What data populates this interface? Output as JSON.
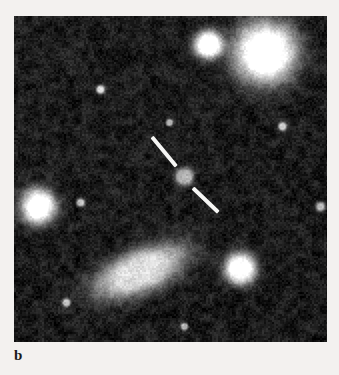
{
  "figure": {
    "panel_letter": "b",
    "kind": "astronomical-ccd-image",
    "background_color": "#f3f1ef",
    "sky_color": "#0b0b0b",
    "marker_color": "#f6f6f4"
  },
  "image_panel": {
    "x": 14,
    "y": 16,
    "width": 313,
    "height": 326,
    "noise": {
      "seed": 20240517,
      "cell_size": 2,
      "base_level": 14,
      "amplitude": 30,
      "blotch_scale": 7,
      "blotch_amplitude": 16
    }
  },
  "sources": [
    {
      "name": "bright-star-upper-right",
      "cx": 251,
      "cy": 36,
      "core_radius": 13,
      "halo_radius": 33,
      "peak": 255,
      "shape": "round",
      "angle": 0,
      "elongation": 1.0
    },
    {
      "name": "star-upper-center",
      "cx": 194,
      "cy": 28,
      "core_radius": 6,
      "halo_radius": 15,
      "peak": 250,
      "shape": "round",
      "angle": 0,
      "elongation": 1.0
    },
    {
      "name": "star-left-edge",
      "cx": 24,
      "cy": 190,
      "core_radius": 7,
      "halo_radius": 19,
      "peak": 252,
      "shape": "round",
      "angle": 0,
      "elongation": 1.0
    },
    {
      "name": "galaxy-lower-center",
      "cx": 126,
      "cy": 255,
      "core_radius": 9,
      "halo_radius": 22,
      "peak": 190,
      "shape": "elongated",
      "angle": -22,
      "elongation": 2.3
    },
    {
      "name": "star-lower-right",
      "cx": 226,
      "cy": 252,
      "core_radius": 7,
      "halo_radius": 16,
      "peak": 246,
      "shape": "round",
      "angle": 0,
      "elongation": 1.0
    },
    {
      "name": "target-object-center",
      "cx": 170,
      "cy": 160,
      "core_radius": 5,
      "halo_radius": 8,
      "peak": 150,
      "shape": "round",
      "angle": 0,
      "elongation": 1.1
    },
    {
      "name": "faint-star-upper-left",
      "cx": 86,
      "cy": 73,
      "core_radius": 2,
      "halo_radius": 4,
      "peak": 185,
      "shape": "round",
      "angle": 0,
      "elongation": 1.0
    },
    {
      "name": "faint-star-mid-left",
      "cx": 66,
      "cy": 186,
      "core_radius": 2,
      "halo_radius": 4,
      "peak": 170,
      "shape": "round",
      "angle": 0,
      "elongation": 1.0
    },
    {
      "name": "faint-star-right-edge",
      "cx": 306,
      "cy": 190,
      "core_radius": 2,
      "halo_radius": 5,
      "peak": 175,
      "shape": "round",
      "angle": 0,
      "elongation": 1.0
    },
    {
      "name": "faint-star-lower-left",
      "cx": 52,
      "cy": 286,
      "core_radius": 2,
      "halo_radius": 4,
      "peak": 160,
      "shape": "round",
      "angle": 0,
      "elongation": 1.0
    },
    {
      "name": "faint-star-upper-right-small",
      "cx": 268,
      "cy": 110,
      "core_radius": 2,
      "halo_radius": 4,
      "peak": 165,
      "shape": "round",
      "angle": 0,
      "elongation": 1.0
    },
    {
      "name": "faint-star-center-upper",
      "cx": 155,
      "cy": 106,
      "core_radius": 2,
      "halo_radius": 3,
      "peak": 155,
      "shape": "round",
      "angle": 0,
      "elongation": 1.0
    },
    {
      "name": "faint-star-bottom-center",
      "cx": 170,
      "cy": 310,
      "core_radius": 2,
      "halo_radius": 3,
      "peak": 150,
      "shape": "round",
      "angle": 0,
      "elongation": 1.0
    }
  ],
  "tick_marks": [
    {
      "name": "tick-mark-upper-left",
      "x1": 138,
      "y1": 121,
      "x2": 162,
      "y2": 150,
      "thickness": 4
    },
    {
      "name": "tick-mark-lower-right",
      "x1": 179,
      "y1": 172,
      "x2": 204,
      "y2": 196,
      "thickness": 4
    }
  ]
}
